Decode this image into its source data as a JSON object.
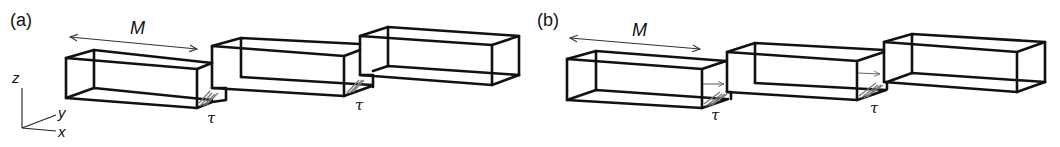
{
  "panels": [
    {
      "id": "a",
      "label": "(a)",
      "length_label": "M",
      "stress_label": "τ",
      "variant": "shear-only"
    },
    {
      "id": "b",
      "label": "(b)",
      "length_label": "M",
      "stress_label": "τ",
      "variant": "shear-with-normal-arrow"
    }
  ],
  "axes": {
    "z": "z",
    "y": "y",
    "x": "x"
  },
  "colors": {
    "line": "#111111",
    "hatch": "#777777",
    "background": "#ffffff"
  }
}
